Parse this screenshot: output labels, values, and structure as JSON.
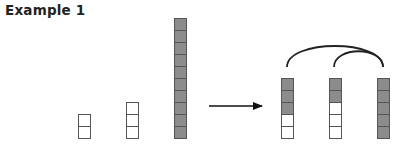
{
  "title": "Example 1",
  "colors": {
    "filled": "#8c8c8c",
    "empty": "#ffffff",
    "stroke": "#555555",
    "arrow": "#111111"
  },
  "cell_size": 12,
  "baseline_y": 138,
  "before": {
    "stacks": [
      {
        "x": 78,
        "filled": 0,
        "empty": 2
      },
      {
        "x": 126,
        "filled": 0,
        "empty": 3
      },
      {
        "x": 174,
        "filled": 10,
        "empty": 0
      }
    ]
  },
  "arrow": {
    "x1": 209,
    "x2": 262,
    "y": 106
  },
  "after": {
    "stacks": [
      {
        "x": 281,
        "filled": 3,
        "empty": 2
      },
      {
        "x": 329,
        "filled": 2,
        "empty": 3
      },
      {
        "x": 377,
        "filled": 5,
        "empty": 0
      }
    ],
    "arcs": [
      {
        "from_x": 287,
        "to_x": 383,
        "y": 67,
        "height": 24
      },
      {
        "from_x": 334,
        "to_x": 383,
        "y": 67,
        "height": 17
      }
    ]
  }
}
